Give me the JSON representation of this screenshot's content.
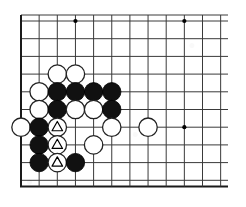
{
  "diagram": {
    "kind": "go-board-diagram",
    "board": {
      "background_color": "#ffffff",
      "line_color": "#3a3a3a",
      "edge_line_color": "#1a1a1a",
      "line_width": 1,
      "edge_line_width": 2,
      "origin_x": 21,
      "origin_y": 21,
      "col_spacing": 18.15,
      "row_spacing": 17.7,
      "cols": 12,
      "rows": 10,
      "clip_right_x": 228,
      "top_edge_y": 15,
      "bottom_edge_y": 186.5,
      "left_edge_x": 21,
      "stone_radius": 9.2
    },
    "star_points": [
      {
        "col": 3,
        "row": 0
      },
      {
        "col": 9,
        "row": 0
      },
      {
        "col": 9,
        "row": 6
      }
    ],
    "star_point_radius": 2.1,
    "stones": [
      {
        "col": 2,
        "row": 3,
        "color": "white",
        "mark": "none"
      },
      {
        "col": 3,
        "row": 3,
        "color": "white",
        "mark": "none"
      },
      {
        "col": 1,
        "row": 4,
        "color": "white",
        "mark": "none"
      },
      {
        "col": 2,
        "row": 4,
        "color": "black",
        "mark": "none"
      },
      {
        "col": 3,
        "row": 4,
        "color": "black",
        "mark": "none"
      },
      {
        "col": 4,
        "row": 4,
        "color": "black",
        "mark": "none"
      },
      {
        "col": 5,
        "row": 4,
        "color": "black",
        "mark": "none"
      },
      {
        "col": 1,
        "row": 5,
        "color": "white",
        "mark": "none"
      },
      {
        "col": 2,
        "row": 5,
        "color": "black",
        "mark": "none"
      },
      {
        "col": 3,
        "row": 5,
        "color": "white",
        "mark": "none"
      },
      {
        "col": 4,
        "row": 5,
        "color": "white",
        "mark": "none"
      },
      {
        "col": 5,
        "row": 5,
        "color": "black",
        "mark": "none"
      },
      {
        "col": 0,
        "row": 6,
        "color": "white",
        "mark": "none"
      },
      {
        "col": 1,
        "row": 6,
        "color": "black",
        "mark": "none"
      },
      {
        "col": 2,
        "row": 6,
        "color": "white",
        "mark": "triangle"
      },
      {
        "col": 5,
        "row": 6,
        "color": "white",
        "mark": "none"
      },
      {
        "col": 7,
        "row": 6,
        "color": "white",
        "mark": "none"
      },
      {
        "col": 1,
        "row": 7,
        "color": "black",
        "mark": "none"
      },
      {
        "col": 2,
        "row": 7,
        "color": "white",
        "mark": "triangle"
      },
      {
        "col": 4,
        "row": 7,
        "color": "white",
        "mark": "none"
      },
      {
        "col": 1,
        "row": 8,
        "color": "black",
        "mark": "none"
      },
      {
        "col": 2,
        "row": 8,
        "color": "white",
        "mark": "triangle"
      },
      {
        "col": 3,
        "row": 8,
        "color": "black",
        "mark": "none"
      }
    ],
    "colors": {
      "black_stone": "#111111",
      "white_stone": "#ffffff",
      "white_stone_border": "#222222",
      "grid": "#3a3a3a",
      "edge": "#1a1a1a",
      "star": "#000000",
      "triangle_mark": "#000000",
      "page_background": "#ffffff"
    }
  }
}
